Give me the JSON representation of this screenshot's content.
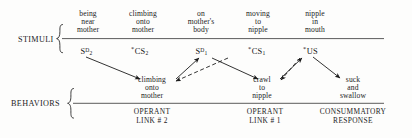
{
  "figure": {
    "rows": [
      {
        "name": "stimuli",
        "label": "STIMULI"
      },
      {
        "name": "behaviors",
        "label": "BEHAVIORS"
      }
    ],
    "stimuli_descriptions": [
      {
        "text": "being\nnear\nmother"
      },
      {
        "text": "climbing\nonto\nmother"
      },
      {
        "text": "on\nmother's\nbody"
      },
      {
        "text": "moving\nto\nnipple"
      },
      {
        "text": "nipple\nin\nmouth"
      }
    ],
    "stimuli_symbols": [
      {
        "star": "",
        "base": "S",
        "sub": "2",
        "sup": "D"
      },
      {
        "star": "*",
        "base": "CS",
        "sub": "2",
        "sup": ""
      },
      {
        "star": "",
        "base": "S",
        "sub": "1",
        "sup": "D"
      },
      {
        "star": "*",
        "base": "CS",
        "sub": "1",
        "sup": ""
      },
      {
        "star": "*",
        "base": "US",
        "sub": "",
        "sup": ""
      }
    ],
    "behavior_descriptions": [
      {
        "text": "climbing\nonto\nmother"
      },
      {
        "text": "crawl\nto\nnipple"
      },
      {
        "text": "suck\nand\nswallow"
      }
    ],
    "phases": [
      {
        "text": "OPERANT\nLINK # 2"
      },
      {
        "text": "OPERANT\nLINK # 1"
      },
      {
        "text": "CONSUMMATORY\nRESPONSE"
      }
    ],
    "colors": {
      "ink": "#1c1c1c",
      "rule": "#4a4a4a",
      "background": "#fdfdfc"
    }
  }
}
